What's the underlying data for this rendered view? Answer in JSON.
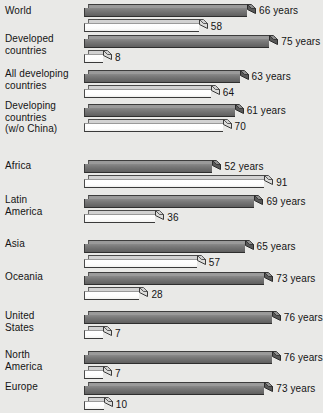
{
  "chart_data": {
    "type": "bar",
    "orientation": "horizontal",
    "title": "",
    "subtitle": "",
    "xlabel": "",
    "ylabel": "",
    "grid": false,
    "legend_position": "none",
    "style": "3d-grayscale-scan",
    "categories": [
      "World",
      "Developed\ncountries",
      "All developing\ncountries",
      "Developing\ncountries\n(w/o China)",
      "Africa",
      "Latin\nAmerica",
      "Asia",
      "Oceania",
      "United\nStates",
      "North\nAmerica",
      "Europe"
    ],
    "series": [
      {
        "name": "Life expectancy",
        "unit": "years",
        "color": "#6f6f6f",
        "values": [
          66,
          75,
          63,
          61,
          52,
          69,
          65,
          73,
          76,
          76,
          73
        ],
        "labels": [
          "66 years",
          "75 years",
          "63 years",
          "61 years",
          "52 years",
          "69 years",
          "65 years",
          "73 years",
          "76 years",
          "76 years",
          "73 years"
        ]
      },
      {
        "name": "Infant mortality",
        "unit": "",
        "color": "#ffffff",
        "values": [
          58,
          8,
          64,
          70,
          91,
          36,
          57,
          28,
          7,
          7,
          10
        ],
        "labels": [
          "58",
          "8",
          "64",
          "70",
          "91",
          "36",
          "57",
          "28",
          "7",
          "7",
          "10"
        ]
      }
    ],
    "rows": [
      {
        "category": "World",
        "years": 66,
        "years_label": "66 years",
        "mortality": 58,
        "mortality_label": "58"
      },
      {
        "category": "Developed countries",
        "years": 75,
        "years_label": "75 years",
        "mortality": 8,
        "mortality_label": "8"
      },
      {
        "category": "All developing countries",
        "years": 63,
        "years_label": "63 years",
        "mortality": 64,
        "mortality_label": "64"
      },
      {
        "category": "Developing countries (w/o China)",
        "years": 61,
        "years_label": "61 years",
        "mortality": 70,
        "mortality_label": "70"
      },
      {
        "category": "Africa",
        "years": 52,
        "years_label": "52 years",
        "mortality": 91,
        "mortality_label": "91"
      },
      {
        "category": "Latin America",
        "years": 69,
        "years_label": "69 years",
        "mortality": 36,
        "mortality_label": "36"
      },
      {
        "category": "Asia",
        "years": 65,
        "years_label": "65 years",
        "mortality": 57,
        "mortality_label": "57"
      },
      {
        "category": "Oceania",
        "years": 73,
        "years_label": "73 years",
        "mortality": 28,
        "mortality_label": "28"
      },
      {
        "category": "United States",
        "years": 76,
        "years_label": "76 years",
        "mortality": 7,
        "mortality_label": "7"
      },
      {
        "category": "North America",
        "years": 76,
        "years_label": "76 years",
        "mortality": 7,
        "mortality_label": "7"
      },
      {
        "category": "Europe",
        "years": 73,
        "years_label": "73 years",
        "mortality": 10,
        "mortality_label": "10"
      }
    ]
  },
  "labels": {
    "row0": "World",
    "row1": "Developed\ncountries",
    "row2": "All developing\ncountries",
    "row3": "Developing\ncountries\n(w/o China)",
    "row4": "Africa",
    "row5": "Latin\nAmerica",
    "row6": "Asia",
    "row7": "Oceania",
    "row8": "United\nStates",
    "row9": "North\nAmerica",
    "row10": "Europe"
  },
  "colors": {
    "background": "#e9e9e7",
    "bar_years_front": "#6f6f6f",
    "bar_years_top": "#9a9a9a",
    "bar_mortality_front": "#ffffff",
    "bar_mortality_top": "#d2d2d2",
    "text": "#141414"
  }
}
